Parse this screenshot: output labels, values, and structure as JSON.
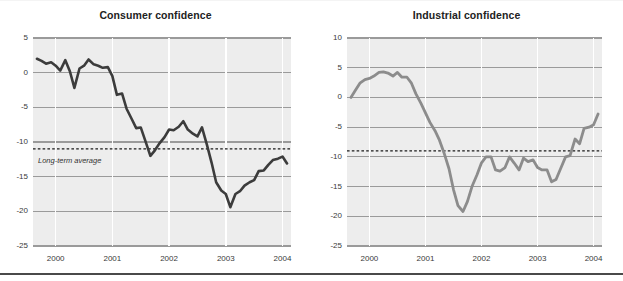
{
  "figure": {
    "width": 623,
    "height": 281,
    "background": "#ffffff",
    "plot_background": "#ededed",
    "gridline_color": "#9a9a9a",
    "vertical_gridline_color": "#ffffff",
    "bottom_rule_color": "#4a4a4a"
  },
  "chart_data": [
    {
      "type": "line",
      "id": "consumer-confidence",
      "title": "Consumer confidence",
      "xlabel": "",
      "ylabel": "",
      "xlim": [
        1999.6,
        2004.15
      ],
      "ylim": [
        -25,
        5
      ],
      "yticks": [
        5,
        0,
        -5,
        -10,
        -15,
        -20,
        -25
      ],
      "ytick_labels": [
        "5",
        "0",
        "-5",
        "-10",
        "-15",
        "-20",
        "-25"
      ],
      "xticks": [
        2000,
        2001,
        2002,
        2003,
        2004
      ],
      "xtick_labels": [
        "2000",
        "2001",
        "2002",
        "2003",
        "2004"
      ],
      "grid": true,
      "legend": "none",
      "line_color": "#3c3c3c",
      "line_width": 2.6,
      "annotations": [
        {
          "name": "long-term-average",
          "label": "Long-term average",
          "type": "hline",
          "value": -11,
          "style": "dashed",
          "color": "#1a1a1a"
        }
      ],
      "x": [
        1999.67,
        1999.75,
        1999.83,
        1999.92,
        2000.0,
        2000.08,
        2000.17,
        2000.25,
        2000.33,
        2000.42,
        2000.5,
        2000.58,
        2000.67,
        2000.75,
        2000.83,
        2000.92,
        2001.0,
        2001.08,
        2001.17,
        2001.25,
        2001.33,
        2001.42,
        2001.5,
        2001.58,
        2001.67,
        2001.75,
        2001.83,
        2001.92,
        2002.0,
        2002.08,
        2002.17,
        2002.25,
        2002.33,
        2002.42,
        2002.5,
        2002.58,
        2002.67,
        2002.75,
        2002.83,
        2002.92,
        2003.0,
        2003.08,
        2003.17,
        2003.25,
        2003.33,
        2003.42,
        2003.5,
        2003.58,
        2003.67,
        2003.75,
        2003.83,
        2003.92,
        2004.0,
        2004.08
      ],
      "y": [
        2.0,
        1.7,
        1.3,
        1.5,
        1.0,
        0.3,
        1.8,
        0.2,
        -2.2,
        0.6,
        1.0,
        1.9,
        1.2,
        1.0,
        0.7,
        0.8,
        -0.5,
        -3.2,
        -3.0,
        -5.2,
        -6.5,
        -8.0,
        -7.9,
        -9.8,
        -12.0,
        -11.2,
        -10.2,
        -9.3,
        -8.2,
        -8.3,
        -7.8,
        -7.0,
        -8.2,
        -8.8,
        -9.2,
        -7.9,
        -10.5,
        -13.0,
        -15.8,
        -17.0,
        -17.5,
        -19.4,
        -17.5,
        -17.1,
        -16.3,
        -15.8,
        -15.5,
        -14.2,
        -14.1,
        -13.3,
        -12.6,
        -12.4,
        -12.1,
        -13.1
      ]
    },
    {
      "type": "line",
      "id": "industrial-confidence",
      "title": "Industrial confidence",
      "xlabel": "",
      "ylabel": "",
      "xlim": [
        1999.6,
        2004.15
      ],
      "ylim": [
        -25,
        10
      ],
      "yticks": [
        10,
        5,
        0,
        -5,
        -10,
        -15,
        -20,
        -25
      ],
      "ytick_labels": [
        "10",
        "5",
        "0",
        "-5",
        "-10",
        "-15",
        "-20",
        "-25"
      ],
      "xticks": [
        2000,
        2001,
        2002,
        2003,
        2004
      ],
      "xtick_labels": [
        "2000",
        "2001",
        "2002",
        "2003",
        "2004"
      ],
      "grid": true,
      "legend": "none",
      "line_color": "#8c8c8c",
      "line_width": 2.8,
      "annotations": [
        {
          "name": "long-term-average",
          "label": "Long-term average",
          "type": "hline",
          "value": -9,
          "style": "dashed",
          "color": "#1a1a1a"
        }
      ],
      "x": [
        1999.67,
        1999.75,
        1999.83,
        1999.92,
        2000.0,
        2000.08,
        2000.17,
        2000.25,
        2000.33,
        2000.42,
        2000.5,
        2000.58,
        2000.67,
        2000.75,
        2000.83,
        2000.92,
        2001.0,
        2001.08,
        2001.17,
        2001.25,
        2001.33,
        2001.42,
        2001.5,
        2001.58,
        2001.67,
        2001.75,
        2001.83,
        2001.92,
        2002.0,
        2002.08,
        2002.17,
        2002.25,
        2002.33,
        2002.42,
        2002.5,
        2002.58,
        2002.67,
        2002.75,
        2002.83,
        2002.92,
        2003.0,
        2003.08,
        2003.17,
        2003.25,
        2003.33,
        2003.42,
        2003.5,
        2003.58,
        2003.67,
        2003.75,
        2003.83,
        2003.92,
        2004.0,
        2004.08
      ],
      "y": [
        0.0,
        1.2,
        2.4,
        3.0,
        3.2,
        3.6,
        4.2,
        4.3,
        4.1,
        3.6,
        4.2,
        3.4,
        3.4,
        2.4,
        0.6,
        -1.0,
        -2.6,
        -4.2,
        -5.6,
        -7.2,
        -9.3,
        -12.0,
        -15.5,
        -18.2,
        -19.2,
        -17.5,
        -15.0,
        -13.0,
        -11.0,
        -10.0,
        -10.0,
        -12.2,
        -12.4,
        -11.8,
        -10.0,
        -11.0,
        -12.2,
        -10.2,
        -10.8,
        -10.5,
        -11.8,
        -12.2,
        -12.2,
        -14.2,
        -13.8,
        -11.8,
        -10.0,
        -9.8,
        -7.0,
        -7.8,
        -5.2,
        -5.0,
        -4.6,
        -2.8
      ]
    }
  ]
}
